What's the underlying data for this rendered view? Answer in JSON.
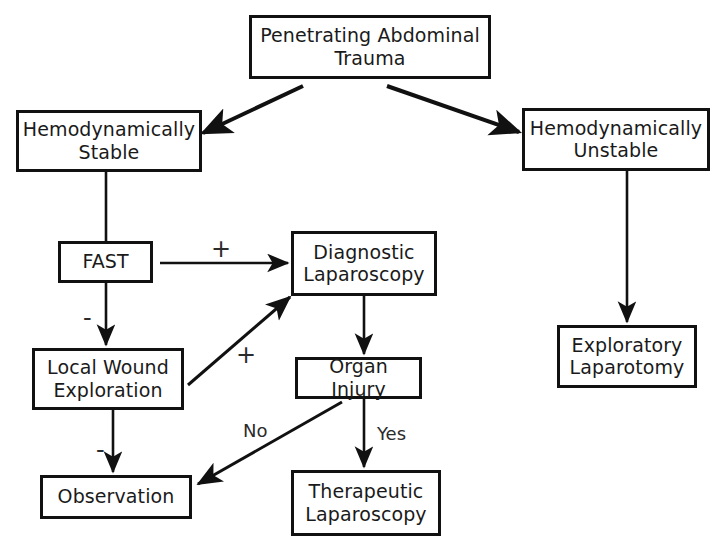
{
  "diagram": {
    "background_color": "#ffffff",
    "line_color": "#111111",
    "text_color": "#1a1a1a"
  },
  "nodes": {
    "root": {
      "label": "Penetrating Abdominal\nTrauma"
    },
    "stable": {
      "label": "Hemodynamically\nStable"
    },
    "unstable": {
      "label": "Hemodynamically\nUnstable"
    },
    "fast": {
      "label": "FAST"
    },
    "diagnostic_laparoscopy": {
      "label": "Diagnostic\nLaparoscopy"
    },
    "local_wound_exploration": {
      "label": "Local Wound\nExploration"
    },
    "organ_injury": {
      "label": "Organ Injury"
    },
    "exploratory_laparotomy": {
      "label": "Exploratory\nLaparotomy"
    },
    "observation": {
      "label": "Observation"
    },
    "therapeutic_laparoscopy": {
      "label": "Therapeutic\nLaparoscopy"
    }
  },
  "edge_labels": {
    "fast_positive": "+",
    "fast_negative": "-",
    "lwe_positive": "+",
    "lwe_negative": "-",
    "organ_injury_no": "No",
    "organ_injury_yes": "Yes"
  },
  "edges": [
    {
      "from": "root",
      "to": "stable",
      "label": ""
    },
    {
      "from": "root",
      "to": "unstable",
      "label": ""
    },
    {
      "from": "stable",
      "to": "fast",
      "label": ""
    },
    {
      "from": "fast",
      "to": "diagnostic_laparoscopy",
      "label": "+"
    },
    {
      "from": "fast",
      "to": "local_wound_exploration",
      "label": "-"
    },
    {
      "from": "local_wound_exploration",
      "to": "diagnostic_laparoscopy",
      "label": "+"
    },
    {
      "from": "local_wound_exploration",
      "to": "observation",
      "label": "-"
    },
    {
      "from": "diagnostic_laparoscopy",
      "to": "organ_injury",
      "label": ""
    },
    {
      "from": "organ_injury",
      "to": "observation",
      "label": "No"
    },
    {
      "from": "organ_injury",
      "to": "therapeutic_laparoscopy",
      "label": "Yes"
    },
    {
      "from": "unstable",
      "to": "exploratory_laparotomy",
      "label": ""
    }
  ]
}
